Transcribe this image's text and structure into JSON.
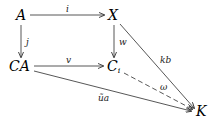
{
  "diagram": {
    "nodes": {
      "A": "A",
      "X": "X",
      "CA": "CA",
      "Ci_base": "C",
      "Ci_sub": "i",
      "K": "K"
    },
    "edges": [
      {
        "from": "A",
        "to": "X",
        "label": "i",
        "style": "solid"
      },
      {
        "from": "A",
        "to": "CA",
        "label": "j",
        "style": "solid"
      },
      {
        "from": "X",
        "to": "Ci",
        "label": "w",
        "style": "solid"
      },
      {
        "from": "CA",
        "to": "Ci",
        "label": "v",
        "style": "solid"
      },
      {
        "from": "X",
        "to": "K",
        "label": "kb",
        "style": "solid"
      },
      {
        "from": "Ci",
        "to": "K",
        "label": "ω",
        "style": "dashed"
      },
      {
        "from": "CA",
        "to": "K",
        "label": "ũa",
        "style": "solid"
      }
    ]
  }
}
